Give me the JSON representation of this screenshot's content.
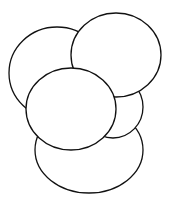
{
  "diagram": {
    "type": "overlapping-circles",
    "stroke_color": "#111111",
    "fill_color": "#ffffff",
    "background": "#ffffff",
    "shapes": [
      {
        "id": "circle-top-left",
        "cx": 57,
        "cy": 73,
        "rx": 48,
        "ry": 46
      },
      {
        "id": "circle-bottom",
        "cx": 89,
        "cy": 150,
        "rx": 54,
        "ry": 43
      },
      {
        "id": "circle-middle-right",
        "cx": 113,
        "cy": 107,
        "rx": 30,
        "ry": 31
      },
      {
        "id": "circle-top-right",
        "cx": 116,
        "cy": 55,
        "rx": 45,
        "ry": 42
      },
      {
        "id": "circle-center",
        "cx": 71,
        "cy": 109,
        "rx": 45,
        "ry": 41
      }
    ]
  }
}
